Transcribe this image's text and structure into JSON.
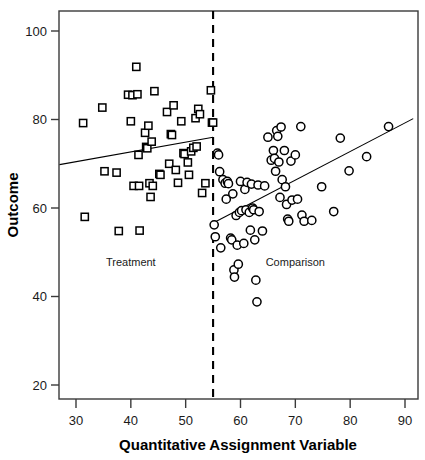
{
  "chart_data": {
    "type": "scatter",
    "title": "",
    "xlabel": "Quantitative Assignment Variable",
    "ylabel": "Outcome",
    "xlim": [
      27,
      92
    ],
    "ylim": [
      15,
      104
    ],
    "xticks": [
      30,
      40,
      50,
      60,
      70,
      80,
      90
    ],
    "yticks": [
      20,
      40,
      60,
      80,
      100
    ],
    "xtick_labels": [
      "30",
      "40",
      "50",
      "60",
      "70",
      "80",
      "90"
    ],
    "ytick_labels": [
      "20",
      "40",
      "60",
      "80",
      "100"
    ],
    "grid": false,
    "legend": "none",
    "cutoff": {
      "value": 55,
      "style": "dashed",
      "orientation": "vertical",
      "label": ""
    },
    "annotations": [
      {
        "text": "Treatment",
        "x": 40,
        "y": 47
      },
      {
        "text": "Comparison",
        "x": 70,
        "y": 47
      }
    ],
    "series": [
      {
        "name": "Treatment",
        "marker": "square",
        "filled": false,
        "color": "#000000",
        "points": [
          [
            31.3,
            79.2
          ],
          [
            31.6,
            58.0
          ],
          [
            34.8,
            82.7
          ],
          [
            35.2,
            68.3
          ],
          [
            37.4,
            68.0
          ],
          [
            37.8,
            54.8
          ],
          [
            39.5,
            85.6
          ],
          [
            40.0,
            79.6
          ],
          [
            40.3,
            85.5
          ],
          [
            40.5,
            65.0
          ],
          [
            41.0,
            91.9
          ],
          [
            41.2,
            85.7
          ],
          [
            41.4,
            72.0
          ],
          [
            41.5,
            65.0
          ],
          [
            41.6,
            54.9
          ],
          [
            42.6,
            77.0
          ],
          [
            42.8,
            73.8
          ],
          [
            43.0,
            73.5
          ],
          [
            43.2,
            78.6
          ],
          [
            43.4,
            65.6
          ],
          [
            43.6,
            62.5
          ],
          [
            43.8,
            75.0
          ],
          [
            44.0,
            65.0
          ],
          [
            44.3,
            86.4
          ],
          [
            45.2,
            67.7
          ],
          [
            45.4,
            67.5
          ],
          [
            46.6,
            81.7
          ],
          [
            47.0,
            70.0
          ],
          [
            47.3,
            76.7
          ],
          [
            47.5,
            76.5
          ],
          [
            47.8,
            83.2
          ],
          [
            48.2,
            68.6
          ],
          [
            48.6,
            65.7
          ],
          [
            49.2,
            79.6
          ],
          [
            49.6,
            72.4
          ],
          [
            49.8,
            72.2
          ],
          [
            50.4,
            70.3
          ],
          [
            50.6,
            67.5
          ],
          [
            51.0,
            72.8
          ],
          [
            51.4,
            73.6
          ],
          [
            51.8,
            80.3
          ],
          [
            52.0,
            73.9
          ],
          [
            52.3,
            82.4
          ],
          [
            52.6,
            81.2
          ],
          [
            53.0,
            63.4
          ],
          [
            53.6,
            65.6
          ],
          [
            54.6,
            86.6
          ],
          [
            54.8,
            79.3
          ],
          [
            55.0,
            79.3
          ]
        ]
      },
      {
        "name": "Comparison",
        "marker": "circle",
        "filled": false,
        "color": "#000000",
        "points": [
          [
            55.2,
            56.2
          ],
          [
            55.4,
            53.5
          ],
          [
            55.8,
            72.4
          ],
          [
            56.0,
            72.0
          ],
          [
            56.2,
            68.2
          ],
          [
            56.4,
            51.0
          ],
          [
            56.8,
            66.4
          ],
          [
            57.2,
            65.6
          ],
          [
            57.4,
            62.0
          ],
          [
            57.6,
            66.0
          ],
          [
            57.8,
            65.5
          ],
          [
            58.2,
            53.2
          ],
          [
            58.4,
            52.8
          ],
          [
            58.6,
            63.2
          ],
          [
            58.8,
            46.0
          ],
          [
            58.9,
            44.4
          ],
          [
            59.2,
            58.3
          ],
          [
            59.4,
            51.6
          ],
          [
            59.6,
            47.3
          ],
          [
            59.8,
            59.0
          ],
          [
            60.0,
            66.0
          ],
          [
            60.2,
            59.4
          ],
          [
            60.6,
            52.0
          ],
          [
            60.8,
            64.2
          ],
          [
            61.0,
            59.6
          ],
          [
            61.2,
            65.8
          ],
          [
            61.6,
            59.0
          ],
          [
            61.8,
            55.0
          ],
          [
            62.0,
            65.4
          ],
          [
            62.2,
            60.0
          ],
          [
            62.4,
            59.6
          ],
          [
            62.6,
            52.8
          ],
          [
            62.8,
            43.7
          ],
          [
            63.0,
            38.8
          ],
          [
            63.2,
            65.2
          ],
          [
            63.4,
            59.2
          ],
          [
            64.0,
            54.8
          ],
          [
            64.4,
            65.0
          ],
          [
            65.0,
            76.0
          ],
          [
            65.6,
            70.8
          ],
          [
            66.0,
            73.0
          ],
          [
            66.2,
            71.2
          ],
          [
            66.4,
            68.3
          ],
          [
            66.6,
            77.5
          ],
          [
            66.8,
            76.2
          ],
          [
            67.0,
            70.4
          ],
          [
            67.2,
            62.4
          ],
          [
            67.4,
            78.3
          ],
          [
            67.6,
            66.4
          ],
          [
            68.0,
            73.0
          ],
          [
            68.2,
            64.8
          ],
          [
            68.4,
            60.8
          ],
          [
            68.6,
            57.5
          ],
          [
            68.8,
            57.0
          ],
          [
            69.2,
            70.6
          ],
          [
            69.4,
            61.8
          ],
          [
            70.0,
            72.0
          ],
          [
            70.4,
            62.0
          ],
          [
            71.0,
            78.4
          ],
          [
            71.2,
            58.4
          ],
          [
            71.6,
            57.0
          ],
          [
            73.0,
            57.2
          ],
          [
            74.8,
            64.8
          ],
          [
            77.0,
            59.2
          ],
          [
            78.2,
            75.8
          ],
          [
            79.8,
            68.4
          ],
          [
            83.0,
            71.6
          ],
          [
            87.0,
            78.4
          ]
        ]
      }
    ],
    "fit_lines": [
      {
        "name": "Treatment fit",
        "group": "Treatment",
        "x_start": 27,
        "y_start": 69.8,
        "x_end": 55,
        "y_end": 76.0,
        "style": "solid"
      },
      {
        "name": "Comparison fit",
        "group": "Comparison",
        "x_start": 55,
        "y_start": 56.6,
        "x_end": 91.5,
        "y_end": 80.2,
        "style": "solid"
      }
    ],
    "discontinuity": 19.4
  }
}
